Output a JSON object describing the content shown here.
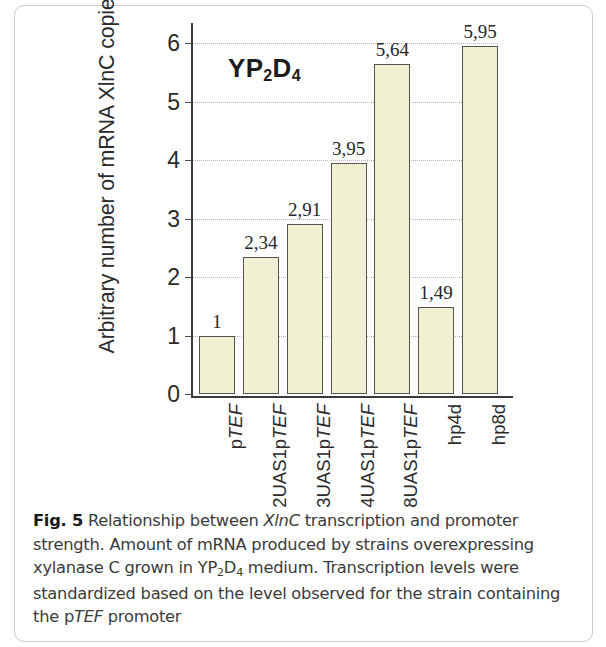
{
  "figure": {
    "label": "Fig. 5",
    "annotation": "YP2D4",
    "annotation_parts": {
      "pre": "YP",
      "sub1": "2",
      "mid": "D",
      "sub2": "4"
    }
  },
  "caption": {
    "bold_label": "Fig. 5",
    "seg1": " Relationship between ",
    "italic1": "XlnC",
    "seg2": " transcription and promoter strength. Amount of mRNA produced by strains overexpressing xylanase C grown in YP",
    "sub1": "2",
    "seg3": "D",
    "sub2": "4",
    "seg4": " medium. Transcription levels were standardized based on the level observed for the strain containing the p",
    "italic2": "TEF",
    "seg5": " promoter",
    "full_text": "Fig. 5 Relationship between XlnC transcription and promoter strength. Amount of mRNA produced by strains overexpressing xylanase C grown in YP2D4 medium. Transcription levels were standardized based on the level observed for the strain containing the pTEF promoter"
  },
  "chart_data": {
    "type": "bar",
    "title": "",
    "annotation": "YP2D4",
    "xlabel": "",
    "ylabel": "Arbitrary number of mRNA XlnC copies",
    "ylim": [
      0,
      6.35
    ],
    "yticks": [
      0,
      1,
      2,
      3,
      4,
      5,
      6
    ],
    "ytick_labels": [
      "0",
      "1",
      "2",
      "3",
      "4",
      "5",
      "6"
    ],
    "grid": true,
    "legend": null,
    "categories": [
      "pTEF",
      "2UAS1pTEF",
      "3UAS1pTEF",
      "4UAS1pTEF",
      "8UAS1pTEF",
      "hp4d",
      "hp8d"
    ],
    "category_styles": [
      "italic-TEF",
      "italic-TEF",
      "italic-TEF",
      "italic-TEF",
      "italic-TEF",
      "roman",
      "roman"
    ],
    "values": [
      1,
      2.34,
      2.91,
      3.95,
      5.64,
      1.49,
      5.95
    ],
    "value_labels": [
      "1",
      "2,34",
      "2,91",
      "3,95",
      "5,64",
      "1,49",
      "5,95"
    ],
    "bar_fill": "#f2f0d2",
    "bar_edge": "#555550"
  }
}
